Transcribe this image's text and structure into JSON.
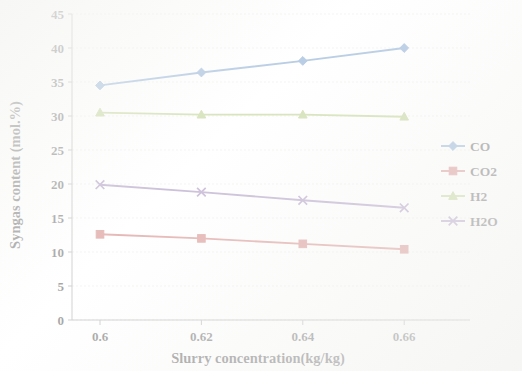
{
  "chart_data": {
    "type": "line",
    "title": "",
    "xlabel": "Slurry concentration(kg/kg)",
    "ylabel": "Syngas content (mol.%)",
    "x": [
      0.6,
      0.62,
      0.64,
      0.66
    ],
    "x_tick_labels": [
      "0.6",
      "0.62",
      "0.64",
      "0.66"
    ],
    "y_tick_labels": [
      "0",
      "5",
      "10",
      "15",
      "20",
      "25",
      "30",
      "35",
      "40",
      "45"
    ],
    "y_ticks": [
      0,
      5,
      10,
      15,
      20,
      25,
      30,
      35,
      40,
      45
    ],
    "ylim": [
      0,
      45
    ],
    "grid": true,
    "legend_position": "right",
    "series": [
      {
        "name": "CO",
        "values": [
          34.5,
          36.4,
          38.1,
          40.0
        ],
        "color": "#4f81bd",
        "marker": "diamond"
      },
      {
        "name": "CO2",
        "values": [
          12.6,
          12.0,
          11.2,
          10.4
        ],
        "color": "#c0504d",
        "marker": "square"
      },
      {
        "name": "H2",
        "values": [
          30.5,
          30.2,
          30.2,
          29.9
        ],
        "color": "#9bbb59",
        "marker": "triangle"
      },
      {
        "name": "H2O",
        "values": [
          19.9,
          18.8,
          17.6,
          16.5
        ],
        "color": "#8064a2",
        "marker": "x"
      }
    ]
  },
  "legend": {
    "items": [
      {
        "label": "CO"
      },
      {
        "label": "CO2"
      },
      {
        "label": "H2"
      },
      {
        "label": "H2O"
      }
    ]
  },
  "axes": {
    "x_title": "Slurry concentration(kg/kg)",
    "y_title": "Syngas content (mol.%)"
  }
}
